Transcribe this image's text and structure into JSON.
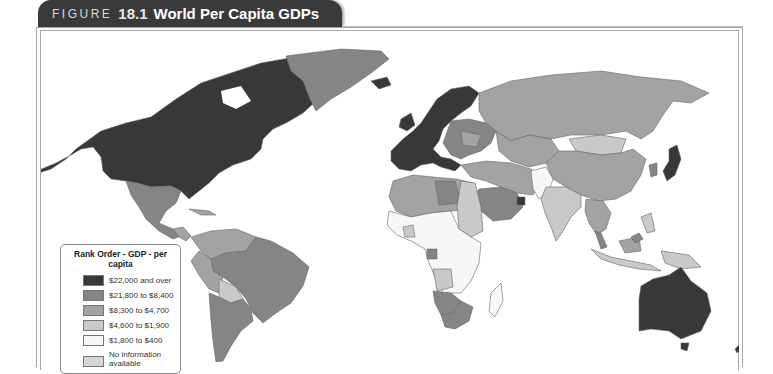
{
  "figure": {
    "label": "FIGURE",
    "number": "18.1",
    "title": "World Per Capita GDPs"
  },
  "legend": {
    "title": "Rank Order - GDP - per capita",
    "items": [
      {
        "label": "$22,000 and over",
        "color": "#383838"
      },
      {
        "label": "$21,800 to $8,400",
        "color": "#858585"
      },
      {
        "label": "$8,300 to $4,700",
        "color": "#a3a3a3"
      },
      {
        "label": "$4,600 to $1,900",
        "color": "#c9c9c9"
      },
      {
        "label": "$1,800 to $400",
        "color": "#f7f7f7"
      },
      {
        "label": "No information available",
        "color": "#d6d6d6"
      }
    ]
  },
  "map": {
    "regions": [
      {
        "name": "North America (US/Canada)",
        "category": "$22,000 and over"
      },
      {
        "name": "Greenland",
        "category": "$21,800 to $8,400"
      },
      {
        "name": "Mexico",
        "category": "$8,300 to $4,700"
      },
      {
        "name": "Western Europe",
        "category": "$22,000 and over"
      },
      {
        "name": "Russia",
        "category": "$8,300 to $4,700"
      },
      {
        "name": "China",
        "category": "$8,300 to $4,700"
      },
      {
        "name": "Mongolia",
        "category": "$4,600 to $1,900"
      },
      {
        "name": "Japan",
        "category": "$22,000 and over"
      },
      {
        "name": "India",
        "category": "$4,600 to $1,900"
      },
      {
        "name": "Saudi Arabia",
        "category": "$21,800 to $8,400"
      },
      {
        "name": "Brazil",
        "category": "$8,300 to $4,700"
      },
      {
        "name": "Argentina",
        "category": "$21,800 to $8,400"
      },
      {
        "name": "Bolivia",
        "category": "$4,600 to $1,900"
      },
      {
        "name": "Central Africa",
        "category": "$1,800 to $400"
      },
      {
        "name": "South Africa",
        "category": "$21,800 to $8,400"
      },
      {
        "name": "Australia",
        "category": "$22,000 and over"
      },
      {
        "name": "New Zealand",
        "category": "$22,000 and over"
      },
      {
        "name": "Indonesia",
        "category": "$4,600 to $1,900"
      }
    ]
  }
}
